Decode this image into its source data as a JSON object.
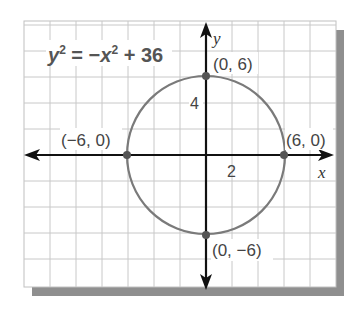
{
  "equation": {
    "lhs_var": "y",
    "lhs_exp": "2",
    "eq": " = −",
    "rhs_var": "x",
    "rhs_exp": "2",
    "rhs_const": " + 36"
  },
  "axes": {
    "x_label": "x",
    "y_label": "y",
    "x_tick_label": "2",
    "y_tick_label": "4"
  },
  "points": [
    {
      "label": "(0, 6)",
      "x": 0,
      "y": 6
    },
    {
      "label": "(−6, 0)",
      "x": -6,
      "y": 0
    },
    {
      "label": "(6, 0)",
      "x": 6,
      "y": 0
    },
    {
      "label": "(0, −6)",
      "x": 0,
      "y": -6
    }
  ],
  "colors": {
    "curve": "#777777",
    "axis": "#111111",
    "grid": "#c8c8c8",
    "shadow": "#8a8a8a",
    "point": "#555555"
  }
}
